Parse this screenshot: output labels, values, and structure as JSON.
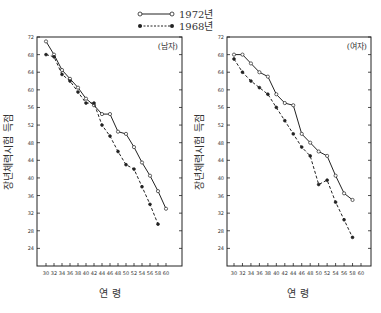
{
  "legend": [
    {
      "label": "1972년",
      "marker": "open-circle",
      "line": "solid"
    },
    {
      "label": "1968년",
      "marker": "filled-circle",
      "line": "dashed"
    }
  ],
  "chart_data": [
    {
      "type": "line",
      "title": "(남자)",
      "xlabel": "연 령",
      "ylabel": "장년체력시험 득점",
      "x": [
        30,
        32,
        34,
        36,
        38,
        40,
        42,
        44,
        46,
        48,
        50,
        52,
        54,
        56,
        58,
        60
      ],
      "xticks": [
        "30",
        "32",
        "34",
        "36",
        "38",
        "40",
        "42",
        "44",
        "46",
        "48",
        "50",
        "52",
        "54",
        "56",
        "58",
        "60"
      ],
      "yticks": [
        "72",
        "68",
        "64",
        "60",
        "56",
        "52",
        "48",
        "44",
        "40",
        "36",
        "32",
        "28",
        "24"
      ],
      "ylim": [
        20,
        72
      ],
      "xlim": [
        28,
        62
      ],
      "series": [
        {
          "name": "1972년",
          "x": [
            30,
            32,
            34,
            36,
            38,
            40,
            42,
            44,
            46,
            48,
            50,
            52,
            54,
            56,
            58,
            60
          ],
          "values": [
            71,
            68,
            64.5,
            62.5,
            60.5,
            58,
            56.5,
            54.5,
            54.5,
            50.5,
            50,
            47,
            43.5,
            40.5,
            37,
            33
          ]
        },
        {
          "name": "1968년",
          "x": [
            30,
            32,
            34,
            36,
            38,
            40,
            42,
            44,
            46,
            48,
            50,
            52,
            54,
            56,
            58
          ],
          "values": [
            68,
            67.5,
            63.5,
            62,
            59.5,
            57,
            57,
            52,
            49.5,
            46,
            43,
            42,
            38,
            34,
            29.5
          ]
        }
      ]
    },
    {
      "type": "line",
      "title": "(여자)",
      "xlabel": "연 령",
      "ylabel": "장년체력시험 득점",
      "x": [
        30,
        32,
        34,
        36,
        38,
        40,
        42,
        44,
        46,
        48,
        50,
        52,
        54,
        56,
        58,
        60
      ],
      "xticks": [
        "30",
        "32",
        "34",
        "36",
        "38",
        "40",
        "42",
        "44",
        "46",
        "48",
        "50",
        "52",
        "54",
        "56",
        "58",
        "60"
      ],
      "yticks": [
        "72",
        "68",
        "64",
        "60",
        "56",
        "52",
        "48",
        "44",
        "40",
        "36",
        "32",
        "28",
        "24"
      ],
      "ylim": [
        20,
        72
      ],
      "xlim": [
        28,
        62
      ],
      "series": [
        {
          "name": "1972년",
          "x": [
            30,
            32,
            34,
            36,
            38,
            40,
            42,
            44,
            46,
            48,
            50,
            52,
            54,
            56,
            58
          ],
          "values": [
            68,
            68,
            66,
            64,
            63,
            59,
            57,
            56.5,
            50,
            48,
            46,
            45,
            40.5,
            36.5,
            35
          ]
        },
        {
          "name": "1968년",
          "x": [
            30,
            32,
            34,
            36,
            38,
            40,
            42,
            44,
            46,
            48,
            50,
            52,
            54,
            56,
            58
          ],
          "values": [
            67,
            64,
            62,
            60.5,
            59,
            56,
            53,
            50,
            47,
            45,
            38.5,
            39.5,
            34.5,
            30.5,
            26.5
          ]
        }
      ]
    }
  ]
}
